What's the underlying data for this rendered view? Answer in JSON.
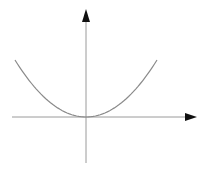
{
  "figure": {
    "background": "#ffffff",
    "axis_color": "#9a9a9a",
    "arrow_color": "#111111",
    "curve_color": "#8a8a8a"
  },
  "chart_data": {
    "type": "line",
    "title": "",
    "xlabel": "",
    "ylabel": "",
    "grid": false,
    "legend": null,
    "axes": {
      "x_arrow": "positive",
      "y_arrow": "positive",
      "ticks": false
    },
    "series": [
      {
        "name": "parabola",
        "shape": "y = x^2 (approximate, unscaled)",
        "x": [
          -1.0,
          -0.75,
          -0.5,
          -0.25,
          0.0,
          0.25,
          0.5,
          0.75,
          1.0
        ],
        "y": [
          1.0,
          0.5625,
          0.25,
          0.0625,
          0.0,
          0.0625,
          0.25,
          0.5625,
          1.0
        ]
      }
    ]
  }
}
